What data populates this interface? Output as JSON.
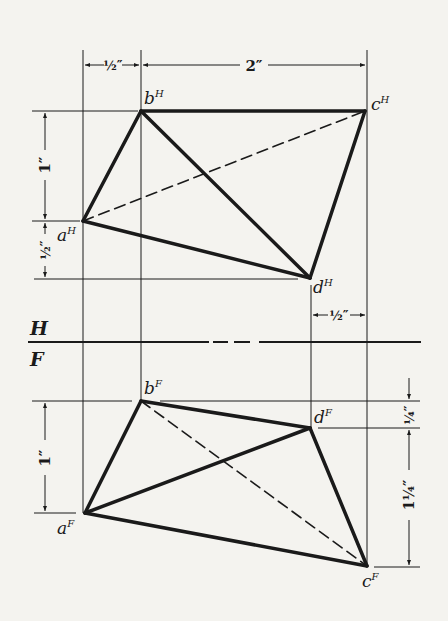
{
  "figure": {
    "type": "orthographic-projection",
    "planes": {
      "top": "H",
      "bottom": "F"
    },
    "colors": {
      "line": "#1a1a1a",
      "background": "#f4f3ef"
    }
  },
  "points": {
    "top_view": [
      {
        "id": "aH",
        "base": "a",
        "sup": "H"
      },
      {
        "id": "bH",
        "base": "b",
        "sup": "H"
      },
      {
        "id": "cH",
        "base": "c",
        "sup": "H"
      },
      {
        "id": "dH",
        "base": "d",
        "sup": "H"
      }
    ],
    "front_view": [
      {
        "id": "aF",
        "base": "a",
        "sup": "F"
      },
      {
        "id": "bF",
        "base": "b",
        "sup": "F"
      },
      {
        "id": "cF",
        "base": "c",
        "sup": "F"
      },
      {
        "id": "dF",
        "base": "d",
        "sup": "F"
      }
    ]
  },
  "dimensions": {
    "top_a_to_b": {
      "whole": "",
      "num": "1",
      "den": "2",
      "unit": "″"
    },
    "top_b_to_c": {
      "whole": "2",
      "num": "",
      "den": "",
      "unit": "″"
    },
    "left_b_to_a_H": {
      "whole": "1",
      "num": "",
      "den": "",
      "unit": "″"
    },
    "left_a_to_d_H": {
      "whole": "",
      "num": "1",
      "den": "2",
      "unit": "″"
    },
    "d_to_c_H": {
      "whole": "",
      "num": "1",
      "den": "2",
      "unit": "″"
    },
    "left_b_to_a_F": {
      "whole": "1",
      "num": "",
      "den": "",
      "unit": "″"
    },
    "right_b_to_d_F": {
      "whole": "",
      "num": "1",
      "den": "4",
      "unit": "″"
    },
    "right_d_to_c_F": {
      "whole": "1",
      "num": "1",
      "den": "4",
      "unit": "″"
    }
  },
  "labels": {
    "aH": "a",
    "aH_sup": "H",
    "bH": "b",
    "bH_sup": "H",
    "cH": "c",
    "cH_sup": "H",
    "dH": "d",
    "dH_sup": "H",
    "aF": "a",
    "aF_sup": "F",
    "bF": "b",
    "bF_sup": "F",
    "cF": "c",
    "cF_sup": "F",
    "dF": "d",
    "dF_sup": "F",
    "plane_H": "H",
    "plane_F": "F",
    "dim_half_top": "½″",
    "dim_two": "2″",
    "dim_one_H": "1″",
    "dim_half_left_H": "½″",
    "dim_half_right_H": "½″",
    "dim_one_F": "1″",
    "dim_quarter_F": "¼″",
    "dim_one_quarter_F": "1¼″"
  }
}
